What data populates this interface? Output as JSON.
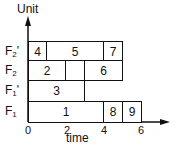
{
  "diagram": {
    "type": "gantt",
    "y_axis_label": "Unit",
    "x_axis_label": "time",
    "x_ticks": [
      "0",
      "2",
      "4",
      "6"
    ],
    "rows": [
      {
        "label_main": "F",
        "label_sub": "2",
        "label_prime": "'",
        "tasks": [
          {
            "label": "4",
            "start": 0,
            "end": 1
          },
          {
            "label": "5",
            "start": 1,
            "end": 4
          },
          {
            "label": "7",
            "start": 4,
            "end": 5
          }
        ]
      },
      {
        "label_main": "F",
        "label_sub": "2",
        "label_prime": "",
        "tasks": [
          {
            "label": "2",
            "start": 0,
            "end": 2
          },
          {
            "label": "",
            "start": 2,
            "end": 3
          },
          {
            "label": "6",
            "start": 3,
            "end": 5
          }
        ]
      },
      {
        "label_main": "F",
        "label_sub": "1",
        "label_prime": "'",
        "tasks": [
          {
            "label": "3",
            "start": 0,
            "end": 3
          }
        ]
      },
      {
        "label_main": "F",
        "label_sub": "1",
        "label_prime": "",
        "tasks": [
          {
            "label": "1",
            "start": 0,
            "end": 4
          },
          {
            "label": "8",
            "start": 4,
            "end": 5
          },
          {
            "label": "9",
            "start": 5,
            "end": 6
          }
        ]
      }
    ]
  }
}
